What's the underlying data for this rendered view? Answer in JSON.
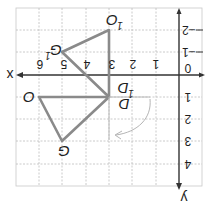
{
  "diagram": {
    "title": "",
    "orientation": "rotated 180 degrees",
    "colors": {
      "grid": "#bdbdbd",
      "axis": "#333333",
      "shape": "#8a8a8a",
      "rotation_arrow": "#b5b5b5",
      "text": "#1e1e1e"
    },
    "axes": {
      "x_label": "x",
      "y_label": "y",
      "origin_label": "0",
      "x_ticks": [
        "1",
        "2",
        "3",
        "4",
        "5",
        "6"
      ],
      "y_ticks": [
        "−2",
        "−1",
        "1",
        "2",
        "3",
        "4"
      ]
    },
    "triangles": [
      {
        "name": "original",
        "vertices": [
          {
            "label": "O",
            "x": 6,
            "y": 1
          },
          {
            "label": "D",
            "x": 3,
            "y": 1
          },
          {
            "label": "G",
            "x": 5,
            "y": 3
          }
        ]
      },
      {
        "name": "image",
        "vertices": [
          {
            "label": "O",
            "sub": "1",
            "x": 3,
            "y": -2
          },
          {
            "label": "D",
            "sub": "1",
            "x": 3,
            "y": 1
          },
          {
            "label": "G",
            "sub": "1",
            "x": 5,
            "y": -1
          }
        ]
      }
    ],
    "labels": {
      "O": "O",
      "G": "G",
      "D": "D",
      "D1": "D",
      "D1_sub": "1",
      "O1": "O",
      "O1_sub": "1",
      "G1": "G",
      "G1_sub": "1"
    },
    "annotations": {
      "rotation_arrow": "curved arrow around D indicating rotation"
    }
  }
}
